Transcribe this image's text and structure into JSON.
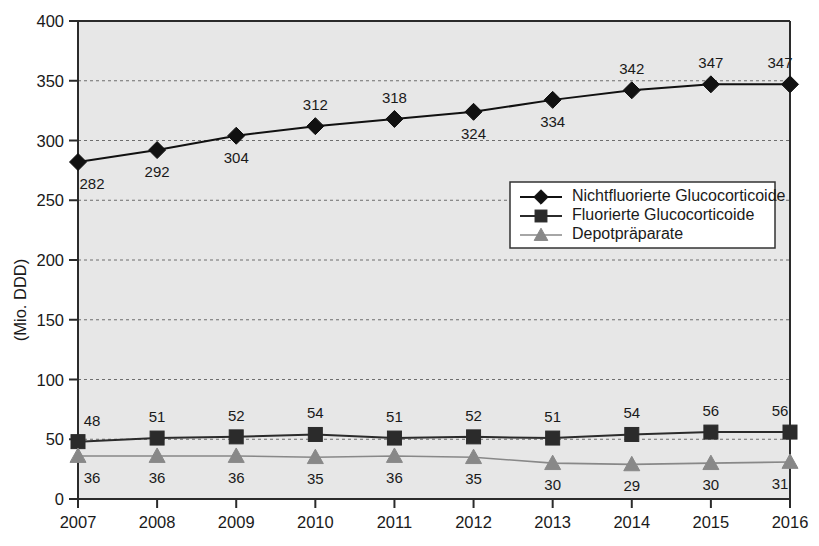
{
  "chart_data": {
    "type": "line",
    "title": "",
    "xlabel": "",
    "ylabel": "(Mio. DDD)",
    "categories": [
      "2007",
      "2008",
      "2009",
      "2010",
      "2011",
      "2012",
      "2013",
      "2014",
      "2015",
      "2016"
    ],
    "ylim": [
      0,
      400
    ],
    "yticks": [
      0,
      50,
      100,
      150,
      200,
      250,
      300,
      350,
      400
    ],
    "ytick_labels": [
      "0",
      "50",
      "100",
      "150",
      "200",
      "250",
      "300",
      "350",
      "400"
    ],
    "grid": true,
    "grid_style": "dotted",
    "legend_position": "inside-right-upper",
    "series": [
      {
        "name": "Nichtfluorierte Glucocorticoide",
        "marker": "diamond",
        "color": "#111111",
        "values": [
          282,
          292,
          304,
          312,
          318,
          324,
          334,
          342,
          347,
          347
        ],
        "label_placement": [
          "below",
          "below",
          "below",
          "above",
          "above",
          "below",
          "below",
          "above",
          "above",
          "above"
        ]
      },
      {
        "name": "Fluorierte Glucocorticoide",
        "marker": "square",
        "color": "#2b2b2b",
        "values": [
          48,
          51,
          52,
          54,
          51,
          52,
          51,
          54,
          56,
          56
        ],
        "label_placement": [
          "above",
          "above",
          "above",
          "above",
          "above",
          "above",
          "above",
          "above",
          "above",
          "above"
        ]
      },
      {
        "name": "Depotpräparate",
        "marker": "triangle",
        "color": "#888888",
        "values": [
          36,
          36,
          36,
          35,
          36,
          35,
          30,
          29,
          30,
          31
        ],
        "label_placement": [
          "below",
          "below",
          "below",
          "below",
          "below",
          "below",
          "below",
          "below",
          "below",
          "below"
        ]
      }
    ],
    "colors": {
      "plot_background": "#e7e7e7",
      "axis": "#2b2b2b",
      "gridline": "#6e6e6e",
      "text": "#1a1a1a",
      "legend_background": "#ffffff",
      "legend_border": "#333333"
    }
  },
  "legend": {
    "entries": [
      {
        "label": "Nichtfluorierte Glucocorticoide"
      },
      {
        "label": "Fluorierte Glucocorticoide"
      },
      {
        "label": "Depotpräparate"
      }
    ]
  },
  "axes": {
    "y_title": "(Mio. DDD)",
    "y_tick_labels": [
      "400",
      "350",
      "300",
      "250",
      "200",
      "150",
      "100",
      "50",
      "0"
    ],
    "x_tick_labels": [
      "2007",
      "2008",
      "2009",
      "2010",
      "2011",
      "2012",
      "2013",
      "2014",
      "2015",
      "2016"
    ]
  }
}
